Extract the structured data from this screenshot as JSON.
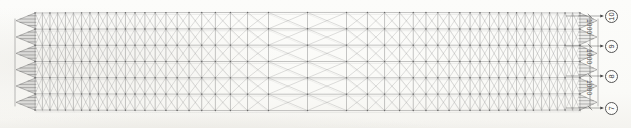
{
  "drawing": {
    "title": "Space Truss Roof Plan",
    "sheet_bg": "#fbfbf9",
    "line_color": "#6e6e6e",
    "accent_color": "#3a3a3a",
    "view_type": "space-frame-perspective-plan",
    "body": {
      "x_left": 35,
      "x_right": 580,
      "y_top": 13,
      "y_bottom": 110
    }
  },
  "grid_bubbles": [
    {
      "label": "10",
      "cx": 611,
      "cy": 16
    },
    {
      "label": "9",
      "cx": 611,
      "cy": 46
    },
    {
      "label": "8",
      "cx": 611,
      "cy": 76
    },
    {
      "label": "7",
      "cx": 611,
      "cy": 108
    }
  ],
  "dimensions": [
    {
      "value": "1000",
      "x": 586,
      "y": 31
    },
    {
      "value": "1000",
      "x": 586,
      "y": 61
    },
    {
      "value": "1000",
      "x": 586,
      "y": 92
    }
  ],
  "truss": {
    "sawtooth_peaks": 6,
    "bays_along_length": 46,
    "bays_across_width": 6,
    "diagonal_pattern": "x-bracing-each-cell",
    "end_profile": "zigzag-sawtooth"
  },
  "chart_data": {
    "type": "table",
    "grid_axis_labels": [
      "10",
      "9",
      "8",
      "7"
    ],
    "bay_dimensions_mm": [
      1000,
      1000,
      1000
    ],
    "xlabel": "",
    "ylabel": ""
  }
}
